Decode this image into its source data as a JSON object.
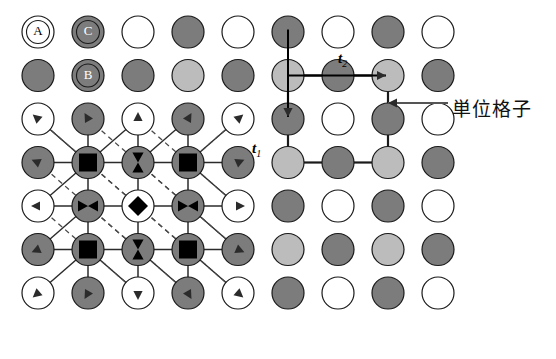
{
  "figure": {
    "title": "",
    "kind": "crystal-lattice-diagram",
    "background": "#ffffff"
  },
  "colors": {
    "white": "#ffffff",
    "dark_gray": "#7c7c7c",
    "light_gray": "#bcbcbc",
    "outline": "#1a1a1a",
    "bond_solid": "#2b2b2b",
    "bond_dashed": "#4a4a4a",
    "marker_black": "#000000",
    "leader": "#555555"
  },
  "lattice": {
    "rows": 7,
    "cols": 9,
    "origin_x": 38,
    "origin_y": 32,
    "step_x": 50,
    "step_y": 43.5,
    "radius": 16,
    "row_fill": [
      [
        "white",
        "dark",
        "white",
        "dark",
        "white",
        "dark",
        "white",
        "dark",
        "white"
      ],
      [
        "dark",
        "dark",
        "dark",
        "light",
        "dark",
        "light",
        "dark",
        "light",
        "dark"
      ],
      [
        "white",
        "dark",
        "white",
        "dark",
        "white",
        "dark",
        "white",
        "dark",
        "white"
      ],
      [
        "dark",
        "dark",
        "dark",
        "dark",
        "dark",
        "light",
        "dark",
        "light",
        "dark"
      ],
      [
        "white",
        "dark",
        "white",
        "dark",
        "white",
        "dark",
        "white",
        "dark",
        "white"
      ],
      [
        "dark",
        "dark",
        "dark",
        "dark",
        "dark",
        "light",
        "dark",
        "light",
        "dark"
      ],
      [
        "white",
        "dark",
        "white",
        "dark",
        "white",
        "dark",
        "white",
        "dark",
        "white"
      ]
    ]
  },
  "atom_labels": [
    {
      "name": "atom-label-a",
      "text": "A",
      "col": 0,
      "row": 0
    },
    {
      "name": "atom-label-c",
      "text": "C",
      "col": 1,
      "row": 0
    },
    {
      "name": "atom-label-b",
      "text": "B",
      "col": 1,
      "row": 1
    }
  ],
  "unit_cell": {
    "label": "単位格子",
    "label_x": 452,
    "label_y": 94,
    "corner_cols": [
      5,
      7
    ],
    "corner_rows": [
      1,
      3
    ],
    "stroke": "#1a1a1a",
    "stroke_width": 2.2
  },
  "vectors": [
    {
      "name": "t1",
      "symbol": "t",
      "subscript": "1",
      "direction": "down",
      "label_x": 252,
      "label_y": 140
    },
    {
      "name": "t2",
      "symbol": "t",
      "subscript": "2",
      "direction": "right",
      "label_x": 338,
      "label_y": 50
    }
  ],
  "leader_arrow": {
    "from_x": 448,
    "from_y": 103,
    "to_x": 388,
    "to_y": 103
  },
  "bond_network": {
    "solid_color": "#2b2b2b",
    "dashed_color": "#4a4a4a",
    "core_cols": [
      1,
      2,
      3
    ],
    "core_rows": [
      3,
      4,
      5
    ],
    "markers": [
      {
        "kind": "square",
        "col": 1,
        "row": 3
      },
      {
        "kind": "bowtie-v",
        "col": 2,
        "row": 3
      },
      {
        "kind": "square",
        "col": 3,
        "row": 3
      },
      {
        "kind": "bowtie-h",
        "col": 1,
        "row": 4
      },
      {
        "kind": "diamond",
        "col": 2,
        "row": 4
      },
      {
        "kind": "bowtie-h",
        "col": 3,
        "row": 4
      },
      {
        "kind": "square",
        "col": 1,
        "row": 5
      },
      {
        "kind": "bowtie-v",
        "col": 2,
        "row": 5
      },
      {
        "kind": "square",
        "col": 3,
        "row": 5
      }
    ]
  }
}
